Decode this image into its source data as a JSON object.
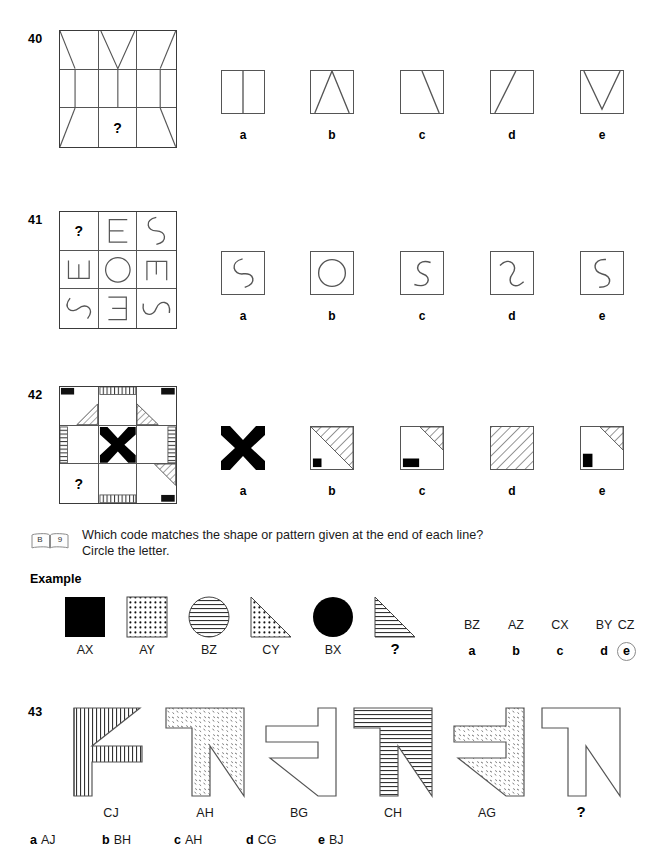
{
  "page": {
    "background": "#ffffff",
    "ink": "#000000",
    "line_color": "#555555"
  },
  "questions": [
    {
      "number": "40",
      "type": "matrix-3x3-missing-cell",
      "matrix_cells": [
        "square-with-left-diagonal",
        "square-with-v-shape",
        "square-with-right-diagonal",
        "square-with-vertical-line",
        "square-with-two-vertical-lines",
        "square-with-vertical-line",
        "square-with-left-diagonal-up",
        "question-mark",
        "square-with-right-diagonal-up"
      ],
      "missing_index": 7,
      "question_mark": "?",
      "options": [
        {
          "letter": "a",
          "shape": "square-two-vertical-bars"
        },
        {
          "letter": "b",
          "shape": "square-triangle-peak"
        },
        {
          "letter": "c",
          "shape": "square-diagonal-top-to-bottom-right"
        },
        {
          "letter": "d",
          "shape": "square-diagonal-bottom-left-to-top"
        },
        {
          "letter": "e",
          "shape": "square-v-shape"
        }
      ]
    },
    {
      "number": "41",
      "type": "matrix-3x3-missing-cell",
      "matrix_cells": [
        "question-mark",
        "letter-E",
        "letter-S-rotated",
        "letter-E-rotated-down",
        "letter-O-circle",
        "letter-E-rotated-up",
        "letter-S",
        "letter-E-mirrored",
        "letter-S-rotated-flat"
      ],
      "missing_index": 0,
      "question_mark": "?",
      "options": [
        {
          "letter": "a",
          "shape": "letter-S-tilted"
        },
        {
          "letter": "b",
          "shape": "letter-O-circle"
        },
        {
          "letter": "c",
          "shape": "letter-S-upright"
        },
        {
          "letter": "d",
          "shape": "letter-S-reversed-tilted"
        },
        {
          "letter": "e",
          "shape": "letter-S-tilted-right"
        }
      ]
    },
    {
      "number": "42",
      "type": "matrix-3x3-missing-cell",
      "matrix_cells": [
        "black-corner-topleft-with-hatched-triangle",
        "vertical-hatch-band-top",
        "black-corner-topright-with-hatched-triangle",
        "vertical-hatch-band-left",
        "black-x-cross",
        "vertical-hatch-band-right",
        "question-mark",
        "vertical-hatch-band-bottom",
        "black-corner-bottomright-with-hatched-triangle"
      ],
      "missing_index": 6,
      "question_mark": "?",
      "options": [
        {
          "letter": "a",
          "shape": "black-x-cross"
        },
        {
          "letter": "b",
          "shape": "diagonal-hatch-upper-right-with-small-black-square"
        },
        {
          "letter": "c",
          "shape": "corner-hatch-with-black-rectangle"
        },
        {
          "letter": "d",
          "shape": "full-diagonal-hatch"
        },
        {
          "letter": "e",
          "shape": "corner-hatch-with-black-square-left"
        }
      ]
    }
  ],
  "instruction": {
    "icon": "open-book-icon",
    "icon_left_page": "B",
    "icon_right_page": "9",
    "line1": "Which code matches the shape or pattern given at the end of each line?",
    "line2": "Circle the letter.",
    "example_header": "Example"
  },
  "example": {
    "shapes": [
      {
        "shape": "black-filled-square",
        "label": "AX"
      },
      {
        "shape": "dotted-square",
        "label": "AY"
      },
      {
        "shape": "circle-horizontal-lines",
        "label": "BZ"
      },
      {
        "shape": "dotted-right-triangle",
        "label": "CY"
      },
      {
        "shape": "black-filled-circle",
        "label": "BX"
      },
      {
        "shape": "horizontal-lined-right-triangle",
        "label": "?"
      }
    ],
    "codes": [
      "BZ",
      "AZ",
      "CX",
      "BY",
      "CZ"
    ],
    "letters": [
      "a",
      "b",
      "c",
      "d",
      "e"
    ],
    "circled_letter": "e"
  },
  "question43": {
    "number": "43",
    "shapes": [
      {
        "shape": "f-shape-vertical-hatch",
        "label": "CJ"
      },
      {
        "shape": "t-shape-speckled",
        "label": "AH"
      },
      {
        "shape": "z-shape-blank",
        "label": "BG"
      },
      {
        "shape": "t-shape-horizontal-hatch",
        "label": "CH"
      },
      {
        "shape": "z-shape-speckled",
        "label": "AG"
      },
      {
        "shape": "t-shape-blank",
        "label": "?"
      }
    ],
    "options": [
      {
        "letter": "a",
        "code": "AJ"
      },
      {
        "letter": "b",
        "code": "BH"
      },
      {
        "letter": "c",
        "code": "AH"
      },
      {
        "letter": "d",
        "code": "CG"
      },
      {
        "letter": "e",
        "code": "BJ"
      }
    ]
  }
}
